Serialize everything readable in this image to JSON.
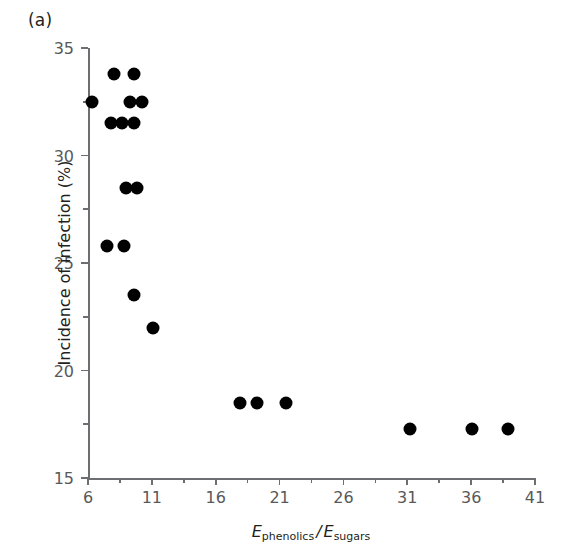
{
  "figure": {
    "panel_label": "(a)",
    "background_color": "#ffffff",
    "marker_color": "#000000",
    "axis_color": "#6d6e71"
  },
  "axis_titles": {
    "y": "Incidence of infection (%)",
    "x_num_symbol": "E",
    "x_num_sub": "phenolics",
    "x_separator": "/",
    "x_den_symbol": "E",
    "x_den_sub": "sugars",
    "x_plain": "E_phenolics / E_sugars"
  },
  "chart_data": {
    "type": "scatter",
    "title": "",
    "subtitle": "",
    "xlabel": "E_phenolics / E_sugars",
    "ylabel": "Incidence of infection (%)",
    "xlim": [
      6,
      41
    ],
    "ylim": [
      15,
      35
    ],
    "xticks": [
      6,
      11,
      16,
      21,
      26,
      31,
      36,
      41
    ],
    "xtick_labels": [
      "6",
      "11",
      "16",
      "21",
      "26",
      "31",
      "36",
      "41"
    ],
    "xticks_minor": [
      8.5,
      13.5,
      18.5,
      23.5,
      28.5,
      33.5,
      38.5
    ],
    "yticks": [
      15,
      20,
      25,
      30,
      35
    ],
    "ytick_labels": [
      "15",
      "20",
      "25",
      "30",
      "35"
    ],
    "yticks_minor": [
      17.5,
      22.5,
      27.5,
      32.5
    ],
    "grid": false,
    "legend": null,
    "marker": "filled-circle",
    "series": [
      {
        "name": "Incidence of infection vs phenolics/sugars ratio",
        "points": [
          {
            "x": 6.3,
            "y": 32.5
          },
          {
            "x": 8.0,
            "y": 33.8
          },
          {
            "x": 9.6,
            "y": 33.8
          },
          {
            "x": 9.3,
            "y": 32.5
          },
          {
            "x": 10.2,
            "y": 32.5
          },
          {
            "x": 7.8,
            "y": 31.5
          },
          {
            "x": 8.7,
            "y": 31.5
          },
          {
            "x": 9.6,
            "y": 31.5
          },
          {
            "x": 9.0,
            "y": 28.5
          },
          {
            "x": 9.8,
            "y": 28.5
          },
          {
            "x": 7.5,
            "y": 25.8
          },
          {
            "x": 8.8,
            "y": 25.8
          },
          {
            "x": 9.6,
            "y": 23.5
          },
          {
            "x": 11.1,
            "y": 22.0
          },
          {
            "x": 17.9,
            "y": 18.5
          },
          {
            "x": 19.2,
            "y": 18.5
          },
          {
            "x": 21.5,
            "y": 18.5
          },
          {
            "x": 31.2,
            "y": 17.3
          },
          {
            "x": 36.1,
            "y": 17.3
          },
          {
            "x": 38.9,
            "y": 17.3
          }
        ]
      }
    ]
  }
}
